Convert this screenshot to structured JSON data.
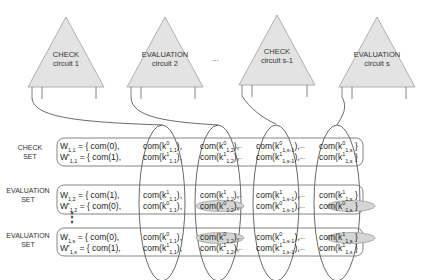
{
  "circuits": [
    {
      "line1": "CHECK",
      "line2": "circuit 1"
    },
    {
      "line1": "EVALUATION",
      "line2": "circuit 2"
    },
    {
      "line1": "CHECK",
      "line2": "circuit s-1"
    },
    {
      "line1": "EVALUATION",
      "line2": "circuit s"
    }
  ],
  "circuit_gap_ellipsis": "...",
  "sets": [
    {
      "label1": "CHECK",
      "label2": "SET",
      "rows": [
        {
          "w": "W",
          "wsub": "1,1",
          "prime": false,
          "first": "= { com(0),",
          "c1": {
            "k": "0",
            "sub": "1,1"
          },
          "c2": {
            "k": "0",
            "sub": "1,2"
          },
          "c3": {
            "k": "0",
            "sub": "1,s-1"
          },
          "c4": {
            "k": "0",
            "sub": "1,s"
          },
          "end": ")}"
        },
        {
          "w": "W'",
          "wsub": "1,1",
          "prime": true,
          "first": "= { com(1),",
          "c1": {
            "k": "1",
            "sub": "1,1"
          },
          "c2": {
            "k": "1",
            "sub": "1,2"
          },
          "c3": {
            "k": "1",
            "sub": "1,s-1"
          },
          "c4": {
            "k": "1",
            "sub": "1,s"
          },
          "end": ")}"
        }
      ]
    },
    {
      "label1": "EVALUATION",
      "label2": "SET",
      "rows": [
        {
          "w": "W",
          "wsub": "1,2",
          "prime": false,
          "first": "= { com(1),",
          "c1": {
            "k": "1",
            "sub": "1,1"
          },
          "c2": {
            "k": "1",
            "sub": "1,2"
          },
          "c3": {
            "k": "1",
            "sub": "1,s-1"
          },
          "c4": {
            "k": "1",
            "sub": "1,s"
          },
          "end": ")}"
        },
        {
          "w": "W'",
          "wsub": "1,2",
          "prime": true,
          "first": "= { com(0),",
          "c1": {
            "k": "0",
            "sub": "1,1"
          },
          "c2": {
            "k": "0",
            "sub": "1,2"
          },
          "c3": {
            "k": "0",
            "sub": "1,s-1"
          },
          "c4": {
            "k": "0",
            "sub": "1,s"
          },
          "end": ")}"
        }
      ],
      "highlighted": [
        "row2.c2",
        "row2.c4"
      ]
    },
    {
      "label1": "EVALUATION",
      "label2": "SET",
      "rows": [
        {
          "w": "W",
          "wsub": "1,s",
          "prime": false,
          "first": "= { com(0),",
          "c1": {
            "k": "0",
            "sub": "1,1"
          },
          "c2": {
            "k": "0",
            "sub": "1,2"
          },
          "c3": {
            "k": "0",
            "sub": "1,s-1"
          },
          "c4": {
            "k": "1",
            "sub": "1,s"
          },
          "end": ")}"
        },
        {
          "w": "W'",
          "wsub": "1,s",
          "prime": true,
          "first": "= { com(1),",
          "c1": {
            "k": "1",
            "sub": "1,1"
          },
          "c2": {
            "k": "1",
            "sub": "1,2"
          },
          "c3": {
            "k": "1",
            "sub": "1,s-1"
          },
          "c4": {
            "k": "1",
            "sub": "1,s"
          },
          "end": ")}"
        }
      ],
      "highlighted": [
        "row1.c2",
        "row1.c4"
      ]
    }
  ],
  "row_ellipsis": "...",
  "vertical_dots": "⋮",
  "colors": {
    "triangle_fill": "#e2e2e2",
    "triangle_stroke": "#9a9a9a",
    "line": "#444444",
    "highlight_fill": "#d4d4d4",
    "box_stroke": "#666666"
  }
}
